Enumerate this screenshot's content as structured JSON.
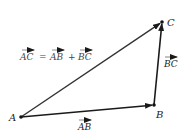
{
  "diagram": {
    "points": {
      "A": {
        "label": "A",
        "x": 21,
        "y": 117
      },
      "B": {
        "label": "B",
        "x": 154,
        "y": 105
      },
      "C": {
        "label": "C",
        "x": 162,
        "y": 22
      }
    },
    "vectors": [
      {
        "name": "AB",
        "label": "AB",
        "from": "A",
        "to": "B"
      },
      {
        "name": "BC",
        "label": "BC",
        "from": "B",
        "to": "C"
      },
      {
        "name": "AC",
        "label": "AC",
        "from": "A",
        "to": "C"
      }
    ],
    "equation": {
      "lhs": "AC",
      "eq": "=",
      "t1": "AB",
      "plus": "+",
      "t2": "BC"
    },
    "colors": {
      "line": "#1a1a1a",
      "text": "#333333"
    }
  }
}
